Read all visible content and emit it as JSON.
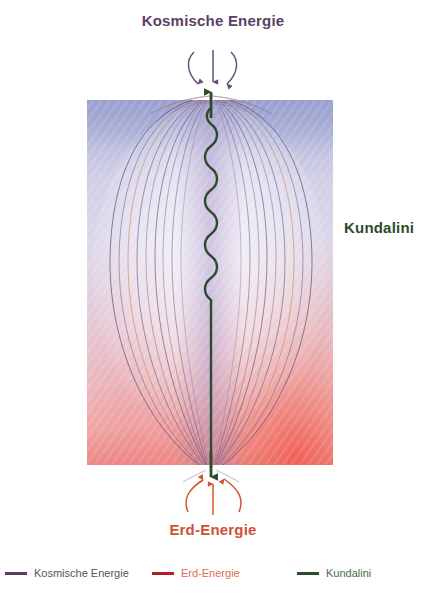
{
  "diagram": {
    "top_label": "Kosmische Energie",
    "right_label": "Kundalini",
    "bottom_label": "Erd-Energie",
    "colors": {
      "cosmic": "#5b3f63",
      "earth": "#b01f2e",
      "kundalini": "#2d4b2e",
      "earth_arrow": "#d4532f",
      "cosmic_arrow": "#6a4c7a",
      "aura_top": "#aab0d8",
      "aura_mid": "#d8d2e8",
      "aura_bottom": "#e8736e",
      "panel_background": "#e9e6f2"
    },
    "arrows": {
      "cosmic_down_count": 3,
      "earth_up_count": 3,
      "kundalini_up_count": 1,
      "kundalini_down_count": 1
    },
    "field_lines": {
      "left_count": 9,
      "right_count": 9,
      "description": "toroidal aura field lines"
    }
  },
  "legend": {
    "items": [
      {
        "label": "Kosmische Energie",
        "color": "#5b3f63"
      },
      {
        "label": "Erd-Energie",
        "color": "#b01f2e"
      },
      {
        "label": "Kundalini",
        "color": "#2d4b2e"
      }
    ]
  }
}
